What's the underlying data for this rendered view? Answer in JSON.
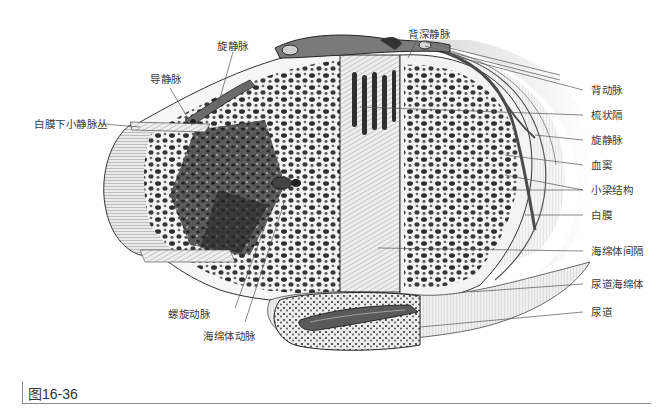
{
  "figure": {
    "caption": "图16-36",
    "labels_left": {
      "subtunical_venular_plexus": "白膜下小静脉丛",
      "emissary_vein": "导静脉",
      "circumflex_vein_top": "旋静脉",
      "helicine_artery": "螺旋动脉",
      "cavernous_artery": "海绵体动脉"
    },
    "labels_top": {
      "deep_dorsal_vein": "背深静脉"
    },
    "labels_right": {
      "dorsal_artery": "背动脉",
      "pectiniform_septum": "梳状隔",
      "circumflex_vein": "旋静脉",
      "sinusoids": "血窦",
      "trabeculae": "小梁结构",
      "tunica_albuginea": "白膜",
      "intercavernous_septum": "海绵体间隔",
      "corpus_spongiosum": "尿道海绵体",
      "urethra": "尿道"
    }
  },
  "colors": {
    "ink": "#2a2a2a",
    "label_text": "#3a3a3a",
    "leader_line": "#555555",
    "tissue_light": "#e8e8e8",
    "tissue_dark": "#4a4a4a"
  }
}
